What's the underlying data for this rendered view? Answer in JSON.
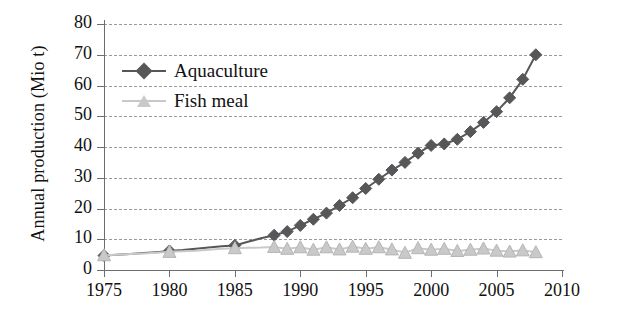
{
  "chart_data": {
    "type": "line",
    "title": "",
    "xlabel": "",
    "ylabel": "Annual production (Mio t)",
    "xlim": [
      1975,
      2010
    ],
    "ylim": [
      0,
      80
    ],
    "xticks": [
      1975,
      1980,
      1985,
      1990,
      1995,
      2000,
      2005,
      2010
    ],
    "yticks": [
      0,
      10,
      20,
      30,
      40,
      50,
      60,
      70,
      80
    ],
    "grid": "horizontal-dashed",
    "legend_position": "upper-left-inside",
    "series": [
      {
        "name": "Aquaculture",
        "color": "#57575a",
        "marker": "diamond",
        "x": [
          1975,
          1976,
          1977,
          1978,
          1979,
          1980,
          1981,
          1982,
          1983,
          1984,
          1985,
          1986,
          1987,
          1988,
          1989,
          1990,
          1991,
          1992,
          1993,
          1994,
          1995,
          1996,
          1997,
          1998,
          1999,
          2000,
          2001,
          2002,
          2003,
          2004,
          2005,
          2006,
          2007,
          2008
        ],
        "values": [
          4.7,
          5.0,
          5.2,
          5.5,
          5.8,
          6.2,
          6.5,
          6.9,
          7.3,
          7.7,
          8.0,
          9.2,
          10.3,
          11.3,
          12.5,
          14.5,
          16.5,
          18.5,
          21.0,
          23.5,
          26.5,
          29.5,
          32.5,
          35.0,
          38.0,
          40.5,
          41.0,
          42.5,
          45.0,
          48.0,
          51.5,
          56.0,
          62.0,
          70.0
        ],
        "marker_years_start": 1988,
        "sparse_marker_years": [
          1975,
          1980,
          1985
        ]
      },
      {
        "name": "Fish meal",
        "color": "#c9c9c9",
        "marker": "triangle",
        "x": [
          1975,
          1976,
          1977,
          1978,
          1979,
          1980,
          1981,
          1982,
          1983,
          1984,
          1985,
          1986,
          1987,
          1988,
          1989,
          1990,
          1991,
          1992,
          1993,
          1994,
          1995,
          1996,
          1997,
          1998,
          1999,
          2000,
          2001,
          2002,
          2003,
          2004,
          2005,
          2006,
          2007,
          2008
        ],
        "values": [
          4.8,
          5.0,
          5.2,
          5.4,
          5.6,
          5.9,
          6.1,
          6.3,
          6.6,
          6.9,
          7.1,
          7.2,
          7.3,
          7.5,
          6.9,
          7.4,
          6.6,
          7.4,
          6.7,
          7.6,
          6.9,
          7.4,
          6.7,
          5.6,
          7.1,
          6.6,
          6.9,
          6.2,
          6.6,
          7.0,
          6.3,
          6.0,
          6.4,
          5.8
        ],
        "marker_years_start": 1988,
        "sparse_marker_years": [
          1975,
          1980,
          1985
        ]
      }
    ]
  },
  "legend": {
    "items": [
      {
        "label": "Aquaculture",
        "color": "#57575a",
        "marker": "diamond"
      },
      {
        "label": "Fish meal",
        "color": "#c9c9c9",
        "marker": "triangle"
      }
    ]
  },
  "axes": {
    "y_title": "Annual production (Mio t)",
    "y_tick_labels": [
      "80",
      "70",
      "60",
      "50",
      "40",
      "30",
      "20",
      "10",
      "0"
    ],
    "x_tick_labels": [
      "1975",
      "1980",
      "1985",
      "1990",
      "1995",
      "2000",
      "2005",
      "2010"
    ]
  },
  "colors": {
    "aquaculture": "#57575a",
    "fish_meal": "#c9c9c9",
    "axis": "#6d6d6d",
    "grid": "#9a9a9a",
    "text": "#111111"
  }
}
